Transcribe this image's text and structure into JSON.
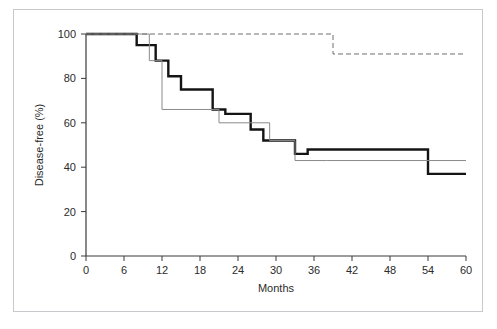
{
  "chart_data": {
    "type": "line",
    "title": "",
    "subtitle": "",
    "xlabel": "Months",
    "ylabel": "Disease-free (%)",
    "xlim": [
      0,
      60
    ],
    "ylim": [
      0,
      100
    ],
    "xticks": [
      0,
      6,
      12,
      18,
      24,
      30,
      36,
      42,
      48,
      54,
      60
    ],
    "xtick_labels": [
      "0",
      "6",
      "12",
      "18",
      "24",
      "30",
      "36",
      "42",
      "48",
      "54",
      "60"
    ],
    "yticks": [
      0,
      20,
      40,
      60,
      80,
      100
    ],
    "ytick_labels": [
      "0",
      "20",
      "40",
      "60",
      "80",
      "100"
    ],
    "grid": false,
    "legend": "none",
    "step_type": "post",
    "annotations": [],
    "series": [
      {
        "name": "curve-thick-black",
        "style": "solid",
        "color": "#141414",
        "linewidth": 2.4,
        "x": [
          0,
          8,
          8,
          11,
          11,
          13,
          13,
          15,
          15,
          17,
          17,
          20,
          20,
          22,
          22,
          26,
          26,
          28,
          28,
          30,
          30,
          33,
          33,
          35,
          35,
          54,
          54,
          60
        ],
        "y": [
          100,
          100,
          95,
          95,
          88,
          88,
          81,
          81,
          75,
          75,
          75,
          75,
          66,
          66,
          64,
          64,
          57,
          57,
          52,
          52,
          52,
          52,
          46,
          46,
          48,
          48,
          37,
          37
        ],
        "values": [
          100,
          100,
          95,
          95,
          88,
          88,
          81,
          81,
          75,
          75,
          75,
          75,
          66,
          66,
          64,
          64,
          57,
          57,
          52,
          52,
          52,
          52,
          46,
          46,
          48,
          48,
          37,
          37
        ]
      },
      {
        "name": "curve-thin-gray",
        "style": "solid",
        "color": "#8a8a8a",
        "linewidth": 1,
        "x": [
          0,
          10,
          10,
          12,
          12,
          21,
          21,
          24,
          24,
          29,
          29,
          33,
          33,
          38,
          38,
          60
        ],
        "y": [
          100,
          100,
          88,
          88,
          66,
          66,
          60,
          60,
          60,
          60,
          52,
          52,
          43,
          43,
          43,
          43
        ],
        "values": [
          100,
          100,
          88,
          88,
          66,
          66,
          60,
          60,
          60,
          60,
          52,
          52,
          43,
          43,
          43,
          43
        ]
      },
      {
        "name": "curve-dashed",
        "style": "dashed",
        "color": "#6f6f74",
        "linewidth": 1,
        "x": [
          0,
          39,
          39,
          60
        ],
        "y": [
          100,
          100,
          91,
          91
        ],
        "values": [
          100,
          100,
          91,
          91
        ]
      }
    ]
  },
  "axes": {
    "y_axis_label": "Disease-free (%)",
    "x_axis_label": "Months"
  },
  "figure": {
    "frame_color": "#c9c9cd",
    "background": "#ffffff",
    "axis_color": "#3a3a3a"
  }
}
